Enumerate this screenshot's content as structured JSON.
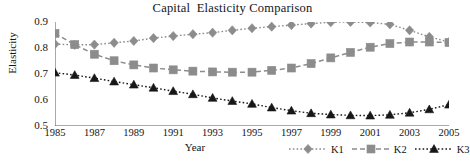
{
  "chart_data": {
    "type": "line",
    "title": "Capital  Elasticity Comparison",
    "xlabel": "Year",
    "ylabel": "Elasticity",
    "x": [
      1985,
      1986,
      1987,
      1988,
      1989,
      1990,
      1991,
      1992,
      1993,
      1994,
      1995,
      1996,
      1997,
      1998,
      1999,
      2000,
      2001,
      2002,
      2003,
      2004,
      2005
    ],
    "xlim": [
      1985,
      2005
    ],
    "ylim": [
      0.5,
      0.9
    ],
    "yticks": [
      "0.5",
      "0.6",
      "0.7",
      "0.8",
      "0.9"
    ],
    "ytick_values": [
      0.5,
      0.6,
      0.7,
      0.8,
      0.9
    ],
    "xticks": [
      "1985",
      "1987",
      "1989",
      "1991",
      "1993",
      "1995",
      "1997",
      "1999",
      "2001",
      "2003",
      "2005"
    ],
    "xtick_values": [
      1985,
      1987,
      1989,
      1991,
      1993,
      1995,
      1997,
      1999,
      2001,
      2003,
      2005
    ],
    "grid": false,
    "legend_position": "bottom-right",
    "series": [
      {
        "name": "K1",
        "marker": "diamond",
        "linestyle": "dotted",
        "color": "#8c8c8c",
        "values": [
          0.815,
          0.812,
          0.813,
          0.82,
          0.827,
          0.838,
          0.846,
          0.853,
          0.859,
          0.868,
          0.876,
          0.882,
          0.888,
          0.894,
          0.899,
          0.9,
          0.898,
          0.891,
          0.868,
          0.843,
          0.823
        ]
      },
      {
        "name": "K2",
        "marker": "square",
        "linestyle": "dashed",
        "color": "#8c8c8c",
        "values": [
          0.856,
          0.813,
          0.776,
          0.751,
          0.735,
          0.723,
          0.716,
          0.711,
          0.708,
          0.707,
          0.707,
          0.714,
          0.723,
          0.74,
          0.762,
          0.783,
          0.803,
          0.817,
          0.823,
          0.823,
          0.821
        ]
      },
      {
        "name": "K3",
        "marker": "triangle",
        "linestyle": "dotted",
        "color": "#171717",
        "values": [
          0.705,
          0.696,
          0.684,
          0.671,
          0.659,
          0.647,
          0.634,
          0.622,
          0.608,
          0.596,
          0.585,
          0.571,
          0.559,
          0.549,
          0.544,
          0.541,
          0.54,
          0.543,
          0.551,
          0.564,
          0.582
        ]
      }
    ]
  }
}
